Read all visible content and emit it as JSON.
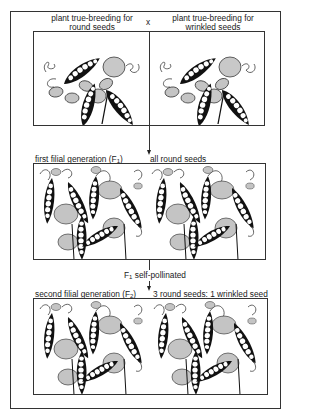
{
  "parents": {
    "left_label_line1": "plant true-breeding for",
    "left_label_line2": "round seeds",
    "cross_symbol": "x",
    "right_label_line1": "plant true-breeding for",
    "right_label_line2": "wrinkled seeds"
  },
  "f1": {
    "label_prefix": "first filial generation (F",
    "label_sub": "1",
    "label_suffix": ")",
    "result": "all round seeds"
  },
  "step": {
    "prefix": "F",
    "sub": "1",
    "text": " self-pollinated"
  },
  "f2": {
    "label_prefix": "second filial generation (F",
    "label_sub": "2",
    "label_suffix": ")",
    "result": "3 round seeds: 1 wrinkled seed"
  },
  "colors": {
    "line": "#333333",
    "pod": "#111111",
    "leaf": "#bdbdbd",
    "background": "#ffffff"
  }
}
